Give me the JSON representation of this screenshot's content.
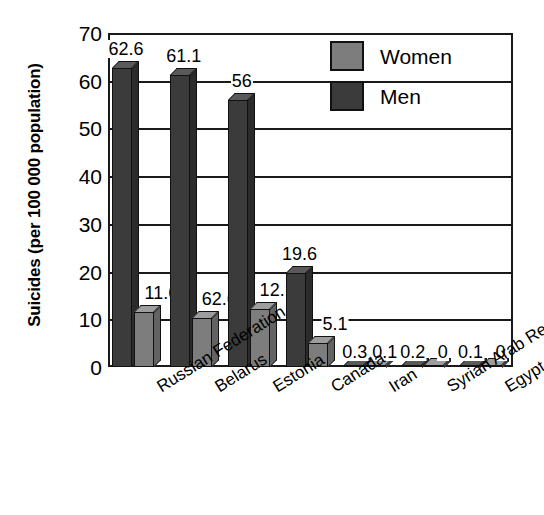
{
  "chart_data": {
    "type": "bar",
    "title": "",
    "xlabel": "",
    "ylabel": "Suicides (per 100 000 population)",
    "ylim": [
      0,
      70
    ],
    "ytick_labels": [
      "0",
      "10",
      "20",
      "30",
      "40",
      "50",
      "60",
      "70"
    ],
    "ytick_values": [
      0,
      10,
      20,
      30,
      40,
      50,
      60,
      70
    ],
    "grid": true,
    "legend_position": "top-right",
    "categories": [
      "Russian Federation",
      "Belarus",
      "Estonia",
      "Canada",
      "Iran",
      "Syrian Arab Republic",
      "Egypt"
    ],
    "series": [
      {
        "name": "Men",
        "color": "#3b3b3b",
        "values": [
          62.6,
          61.1,
          56,
          19.6,
          0.3,
          0.2,
          0.1
        ],
        "data_labels": [
          "62.6",
          "61.1",
          "56",
          "19.6",
          "0.3",
          "0.2",
          "0.1"
        ]
      },
      {
        "name": "Women",
        "color": "#7d7d7d",
        "values": [
          11.6,
          10.2,
          12.1,
          5.1,
          0.1,
          0,
          0
        ],
        "data_labels": [
          "11.6",
          "62.6",
          "12.1",
          "5.1",
          "0.1",
          "0",
          "0"
        ]
      }
    ]
  },
  "legend": {
    "items": [
      {
        "label": "Women",
        "swatch": "women"
      },
      {
        "label": "Men",
        "swatch": "men"
      }
    ]
  }
}
